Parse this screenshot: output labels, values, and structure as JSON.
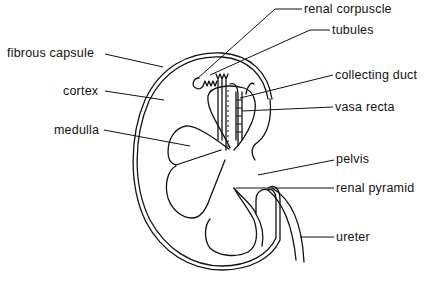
{
  "diagram": {
    "colors": {
      "ink": "#111111",
      "background": "#ffffff"
    },
    "labels": {
      "renal_corpuscle": "renal corpuscle",
      "tubules": "tubules",
      "fibrous_capsule": "fibrous capsule",
      "cortex": "cortex",
      "collecting_duct": "collecting duct",
      "vasa_recta": "vasa recta",
      "medulla": "medulla",
      "pelvis": "pelvis",
      "renal_pyramid": "renal pyramid",
      "ureter": "ureter"
    }
  }
}
